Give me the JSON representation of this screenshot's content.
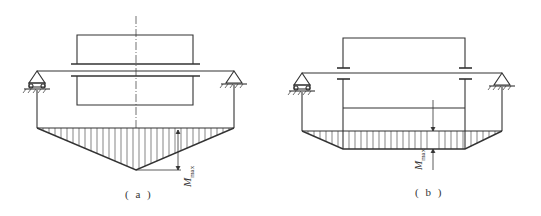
{
  "figures": [
    {
      "id": "a",
      "caption": "( a )",
      "description": "Simply supported shaft with centrally mounted wide gear/drum; triangular bending moment diagram",
      "moment_label": "M",
      "moment_subscript": "max",
      "moment_shape": "triangle"
    },
    {
      "id": "b",
      "caption": "( b )",
      "description": "Simply supported shaft with hub supported at two points; trapezoidal bending moment diagram",
      "moment_label": "M",
      "moment_subscript": "max",
      "moment_shape": "trapezoid"
    }
  ],
  "colors": {
    "line": "#333333",
    "background": "#ffffff"
  }
}
